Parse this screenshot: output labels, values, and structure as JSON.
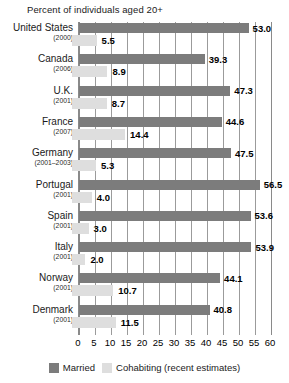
{
  "chart_data": {
    "type": "bar",
    "orientation": "horizontal",
    "title": "Percent of individuals aged 20+",
    "xlabel": "",
    "ylabel": "",
    "xlim": [
      0,
      60
    ],
    "xticks": [
      0,
      5,
      10,
      15,
      20,
      25,
      30,
      35,
      40,
      45,
      50,
      55,
      60
    ],
    "grid": true,
    "grid_axis": "x",
    "legend_position": "bottom-center",
    "categories": [
      "United States",
      "Canada",
      "U.K.",
      "France",
      "Germany",
      "Portugal",
      "Spain",
      "Italy",
      "Norway",
      "Denmark"
    ],
    "category_years": [
      "(2000)",
      "(2006)",
      "(2001)",
      "(2007)",
      "(2001–2003)",
      "(2001)",
      "(2001)",
      "(2001)",
      "(2001)",
      "(2001)"
    ],
    "series": [
      {
        "name": "Married",
        "color": "#7c7c7c",
        "values": [
          53.0,
          39.3,
          47.3,
          44.6,
          47.5,
          56.5,
          53.6,
          53.9,
          44.1,
          40.8
        ],
        "labels": [
          "53.0",
          "39.3",
          "47.3",
          "44.6",
          "47.5",
          "56.5",
          "53.6",
          "53.9",
          "44.1",
          "40.8"
        ]
      },
      {
        "name": "Cohabiting (recent estimates)",
        "color": "#dedede",
        "values": [
          5.5,
          8.9,
          8.7,
          14.4,
          5.3,
          4.0,
          3.0,
          2.0,
          10.7,
          11.5
        ],
        "labels": [
          "5.5",
          "8.9",
          "8.7",
          "14.4",
          "5.3",
          "4.0",
          "3.0",
          "2.0",
          "10.7",
          "11.5"
        ]
      }
    ]
  },
  "legend": {
    "items": [
      {
        "label": "Married",
        "color": "#7c7c7c"
      },
      {
        "label": "Cohabiting (recent estimates)",
        "color": "#dedede"
      }
    ]
  },
  "colors": {
    "married": "#7c7c7c",
    "cohabiting": "#dedede",
    "gridline": "#9b9b9b",
    "axis": "#8a8a8a",
    "text": "#1a1a1a"
  }
}
